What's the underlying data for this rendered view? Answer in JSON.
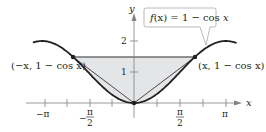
{
  "figure": {
    "function_label": "f(x) = 1 − cos x",
    "function_label_parts": {
      "f": "f",
      "paren_x": "(x) = 1 − cos ",
      "x": "x"
    },
    "left_point_label": "(−x, 1 − cos x)",
    "right_point_label": "(x, 1 − cos x)",
    "axis_x_label": "x",
    "axis_y_label": "y",
    "x_ticks": [
      {
        "label": "−π",
        "value": -3.14159
      },
      {
        "label": "−π/2",
        "value": -1.5708,
        "numerator": "π",
        "denominator": "2",
        "sign": "−"
      },
      {
        "label": "π/2",
        "value": 1.5708,
        "numerator": "π",
        "denominator": "2"
      },
      {
        "label": "π",
        "value": 3.14159
      }
    ],
    "y_ticks": [
      {
        "label": "1",
        "value": 1
      },
      {
        "label": "2",
        "value": 2
      }
    ],
    "colors": {
      "curve": "#231f20",
      "shading": "#e4e5e7",
      "axis": "#808285",
      "callout_border": "#a7a9ac"
    }
  },
  "chart_data": {
    "type": "line",
    "title": "",
    "xlabel": "x",
    "ylabel": "y",
    "series": [
      {
        "name": "f(x) = 1 − cos x",
        "function": "1 - cos(x)",
        "x_range": [
          -3.45,
          3.5
        ]
      }
    ],
    "annotations": [
      {
        "text": "(−x, 1 − cos x)",
        "x": -2.094,
        "y": 1.5
      },
      {
        "text": "(x, 1 − cos x)",
        "x": 2.094,
        "y": 1.5
      },
      {
        "text": "f(x) = 1 − cos x",
        "type": "callout"
      }
    ],
    "shaded_region": "between y = 1.5 and the curve for x in [−2π/3, 2π/3]",
    "chords": [
      {
        "from": [
          0,
          0
        ],
        "to": [
          -2.094,
          1.5
        ]
      },
      {
        "from": [
          0,
          0
        ],
        "to": [
          2.094,
          1.5
        ]
      }
    ],
    "x_ticks": [
      "−π",
      "−π/2",
      "π/2",
      "π"
    ],
    "y_ticks": [
      "1",
      "2"
    ],
    "xlim": [
      -3.6,
      3.8
    ],
    "ylim": [
      0,
      2.9
    ],
    "grid": false
  }
}
